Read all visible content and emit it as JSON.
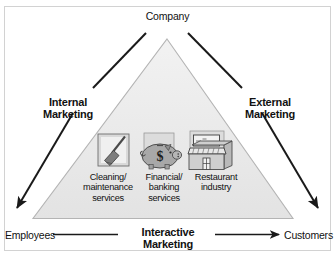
{
  "diagram": {
    "title_top": "Company",
    "left_side": "Internal\nMarketing",
    "right_side": "External\nMarketing",
    "bottom_center": "Interactive\nMarketing",
    "bottom_left": "Employees",
    "bottom_right": "Customers",
    "colors": {
      "triangle_fill": "#eaeaea",
      "triangle_stroke": "#b4b4b4",
      "arrow": "#1a1a1a",
      "text": "#111111",
      "frame": "#d2d2d2",
      "icon_panel": "#d9d9d9",
      "icon_mid": "#a8a8a8",
      "icon_dark": "#6e6e6e"
    },
    "icons": [
      {
        "name": "broom-icon",
        "label": "Cleaning/\nmaintenance\nservices"
      },
      {
        "name": "piggy-bank-icon",
        "label": "Financial/\nbanking\nservices",
        "glyph": "$"
      },
      {
        "name": "restaurant-building-icon",
        "label": "Restaurant\nindustry"
      }
    ],
    "arrows": [
      {
        "name": "company-to-employees-arrow",
        "from": "Company",
        "to": "Employees"
      },
      {
        "name": "company-to-customers-arrow",
        "from": "Company",
        "to": "Customers"
      },
      {
        "name": "employees-to-customers-arrow",
        "from": "Employees",
        "to": "Customers"
      }
    ]
  }
}
